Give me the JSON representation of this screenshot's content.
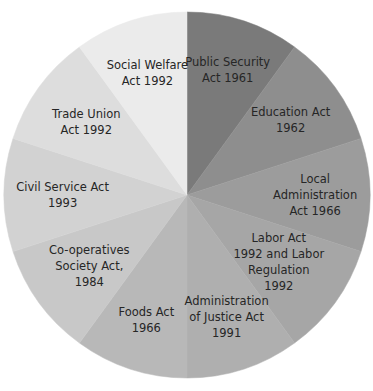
{
  "chart_data": {
    "type": "pie",
    "title": "",
    "start_angle_deg": 0,
    "direction": "clockwise",
    "categories": [
      "Public Security Act 1961",
      "Education Act 1962",
      "Local Administration Act 1966",
      "Labor Act 1992 and Labor Regulation 1992",
      "Administration of Justice Act 1991",
      "Foods Act 1966",
      "Co-operatives Society Act, 1984",
      "Civil Service Act 1993",
      "Trade Union Act 1992",
      "Social Welfare Act 1992"
    ],
    "values": [
      1,
      1,
      1,
      1,
      1,
      1,
      1,
      1,
      1,
      1
    ],
    "legend": "none (labels inside slices)",
    "slices": [
      {
        "label_lines": [
          "Public Security",
          "Act 1961"
        ],
        "color": "#7a7a7a",
        "value": 1
      },
      {
        "label_lines": [
          "Education Act",
          "1962"
        ],
        "color": "#8e8e8e",
        "value": 1
      },
      {
        "label_lines": [
          "Local",
          "Administration",
          "Act 1966"
        ],
        "color": "#9c9c9c",
        "value": 1
      },
      {
        "label_lines": [
          "Labor Act",
          "1992 and Labor",
          "Regulation",
          "1992"
        ],
        "color": "#a6a6a6",
        "value": 1
      },
      {
        "label_lines": [
          "Administration",
          "of Justice Act",
          "1991"
        ],
        "color": "#afafaf",
        "value": 1
      },
      {
        "label_lines": [
          "Foods Act",
          "1966"
        ],
        "color": "#b8b8b8",
        "value": 1
      },
      {
        "label_lines": [
          "Co-operatives",
          "Society Act,",
          "1984"
        ],
        "color": "#c8c8c8",
        "value": 1
      },
      {
        "label_lines": [
          "Civil Service Act",
          "1993"
        ],
        "color": "#d2d2d2",
        "value": 1
      },
      {
        "label_lines": [
          "Trade Union",
          "Act 1992"
        ],
        "color": "#dddddd",
        "value": 1
      },
      {
        "label_lines": [
          "Social Welfare",
          "Act 1992"
        ],
        "color": "#ebebeb",
        "value": 1
      }
    ]
  }
}
